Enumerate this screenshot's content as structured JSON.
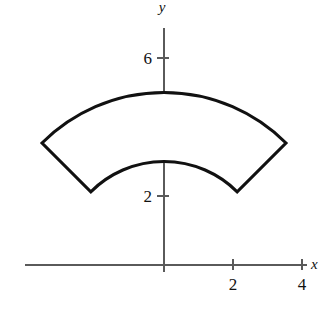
{
  "figure": {
    "background_color": "#ffffff",
    "outline_color": "#111111",
    "hatch_color": "#d2d2d2",
    "axis_color": "#5a5a5a"
  },
  "axes": {
    "x_axis_label": "x",
    "y_axis_label": "y",
    "origin_px": {
      "x": 164,
      "y": 265
    },
    "units_per_pixel": 0.02899,
    "pixels_per_unit": 34.5,
    "x_axis_extent_px": {
      "from": 25,
      "to": 307
    },
    "y_axis_extent_px": {
      "from": 28,
      "to": 272
    },
    "x_ticks": [
      {
        "label": "2",
        "value": 2,
        "px": 233
      },
      {
        "label": "4",
        "value": 4,
        "px": 302
      }
    ],
    "y_ticks": [
      {
        "label": "2",
        "value": 2,
        "px": 196
      },
      {
        "label": "6",
        "value": 6,
        "px": 58
      }
    ]
  },
  "chart_data": {
    "type": "area",
    "xlabel": "x",
    "ylabel": "y",
    "grid": false,
    "legend": null,
    "xlim": [
      -4.03,
      4.81
    ],
    "ylim": [
      -0.2,
      6.87
    ],
    "x_tick_labels": [
      "2",
      "4"
    ],
    "x_tick_values": [
      2,
      4
    ],
    "y_tick_labels": [
      "2",
      "6"
    ],
    "y_tick_values": [
      2,
      6
    ],
    "shading": "vertical-hatch",
    "shading_spacing_px": 4,
    "region": {
      "shape": "annulus-sector",
      "center": [
        0,
        0
      ],
      "inner_radius": 3,
      "outer_radius": 5,
      "start_angle_deg": 45,
      "end_angle_deg": 135,
      "corner_points": [
        {
          "name": "outer-left",
          "x": -3.54,
          "y": 3.54
        },
        {
          "name": "outer-right",
          "x": 3.54,
          "y": 3.54
        },
        {
          "name": "inner-right",
          "x": 2.12,
          "y": 2.12
        },
        {
          "name": "inner-left",
          "x": -2.12,
          "y": 2.12
        }
      ],
      "outer_arc_apex": [
        0,
        5
      ],
      "inner_arc_apex": [
        0,
        3
      ]
    }
  }
}
